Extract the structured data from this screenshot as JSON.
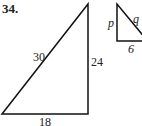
{
  "problem": {
    "number": "34.",
    "large_triangle": {
      "hypotenuse": "30",
      "vertical_leg": "24",
      "horizontal_leg": "18"
    },
    "small_triangle": {
      "vertical_leg": "p",
      "hypotenuse": "q",
      "horizontal_leg": "6"
    }
  }
}
